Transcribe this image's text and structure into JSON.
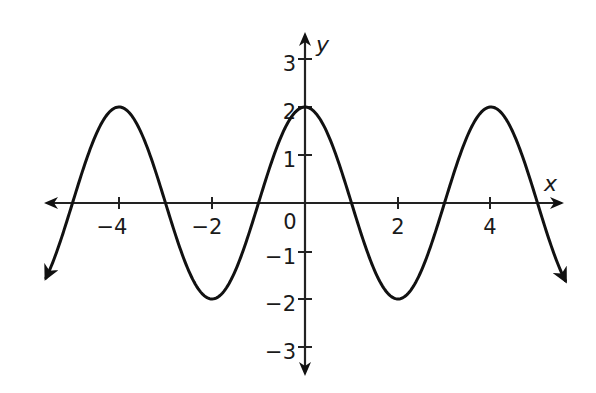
{
  "chart_data": {
    "type": "line",
    "title": "",
    "xlabel": "x",
    "ylabel": "y",
    "function": "y = 2cos(πx/2)",
    "xlim": [
      -5.6,
      5.6
    ],
    "ylim": [
      -3.5,
      3.5
    ],
    "grid": false,
    "x_ticks": [
      -4,
      -2,
      0,
      2,
      4
    ],
    "x_tick_labels": [
      "−4",
      "−2",
      "0",
      "2",
      "4"
    ],
    "y_ticks": [
      -3,
      -2,
      -1,
      1,
      2,
      3
    ],
    "y_tick_labels": [
      "−3",
      "−2",
      "−1",
      "1",
      "2",
      "3"
    ],
    "series": [
      {
        "name": "curve",
        "x": [
          -5.5,
          -5,
          -4.5,
          -4,
          -3.5,
          -3,
          -2.5,
          -2,
          -1.5,
          -1,
          -0.5,
          0,
          0.5,
          1,
          1.5,
          2,
          2.5,
          3,
          3.5,
          4,
          4.5,
          5,
          5.5
        ],
        "values": [
          -1.41,
          0,
          1.41,
          2,
          1.41,
          0,
          -1.41,
          -2,
          -1.41,
          0,
          1.41,
          2,
          1.41,
          0,
          -1.41,
          -2,
          -1.41,
          0,
          1.41,
          2,
          1.41,
          0,
          -1.41
        ]
      }
    ],
    "annotations": {
      "maxima": [
        [
          -4,
          2
        ],
        [
          0,
          2
        ],
        [
          4,
          2
        ]
      ],
      "minima": [
        [
          -2,
          -2
        ],
        [
          2,
          -2
        ]
      ],
      "zeros": [
        -5,
        -3,
        -1,
        1,
        3,
        5
      ]
    },
    "stroke_color": "#111111"
  }
}
